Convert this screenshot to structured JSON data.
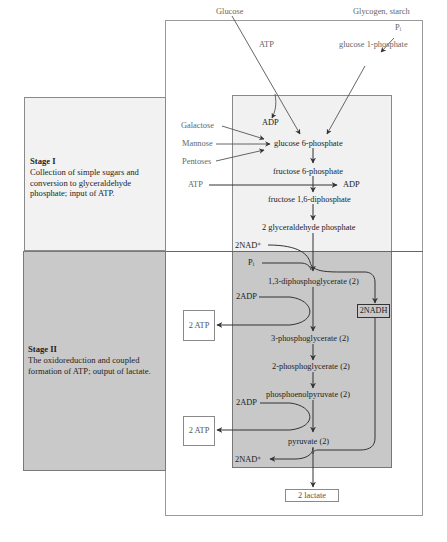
{
  "stages": [
    {
      "title": "Stage I",
      "description": "Collection of simple sugars and conversion to glyceraldehyde phosphate; input of ATP."
    },
    {
      "title": "Stage II",
      "description": "The oxidoreduction and coupled formation of ATP; output of lactate."
    }
  ],
  "inputs": {
    "glucose": "Glucose",
    "glycogen": "Glycogen, starch",
    "pi_top": "Pᵢ",
    "glucose1p": "glucose 1-phosphate",
    "atp_top": "ATP",
    "adp_top": "ADP",
    "galactose": "Galactose",
    "mannose": "Mannose",
    "pentoses": "Pentoses",
    "atp_mid": "ATP",
    "adp_mid": "ADP"
  },
  "pathway": {
    "g6p": "glucose 6-phosphate",
    "f6p": "fructose 6-phosphate",
    "f16dp": "fructose 1,6-diphosphate",
    "gap": "2 glyceraldehyde phosphate",
    "bpg": "1,3-diphosphoglycerate (2)",
    "pg3": "3-phosphoglycerate (2)",
    "pg2": "2-phosphoglycerate (2)",
    "pep": "phosphoenolpyruvate (2)",
    "pyruvate": "pyruvate (2)",
    "lactate": "2 lactate"
  },
  "cofactors": {
    "nad_in": "2NAD⁺",
    "pi": "Pᵢ",
    "adp1": "2ADP",
    "atp_out1": "2 ATP",
    "nadh": "2NADH",
    "adp2": "2ADP",
    "atp_out2": "2 ATP",
    "nad_out": "2NAD⁺"
  },
  "colors": {
    "stage1_bg": "#f2f2f2",
    "stage2_bg": "#c9c9c9",
    "line": "#333333"
  }
}
